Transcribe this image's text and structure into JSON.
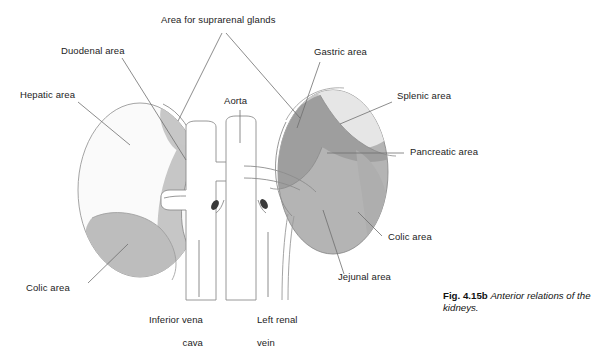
{
  "figure": {
    "title": "Anterior relations of the kidneys",
    "caption_number": "Fig. 4.15b",
    "caption_text": "Anterior relations of the kidneys.",
    "type": "anatomical-line-diagram"
  },
  "labels": {
    "suprarenal": "Area for suprarenal glands",
    "duodenal": "Duodenal area",
    "hepatic": "Hepatic area",
    "aorta": "Aorta",
    "gastric": "Gastric area",
    "splenic": "Splenic area",
    "pancreatic": "Pancreatic area",
    "colic_right": "Colic area",
    "colic_left": "Colic area",
    "jejunal": "Jejunal area",
    "ivc_line1": "Inferior vena",
    "ivc_line2": "cava",
    "renal_vein_line1": "Left renal",
    "renal_vein_line2": "vein"
  },
  "colors": {
    "outline": "#8c8c8c",
    "leader": "#6e6e6e",
    "hepatic_fill": "#fafafa",
    "duodenal_fill": "#c6c6c6",
    "suprarenal_fill": "#c4c4c4",
    "colic_right_fill": "#bdbdbd",
    "splenic_fill": "#e6e6e6",
    "gastric_fill": "#c9c9c9",
    "pancreatic_fill": "#9e9e9e",
    "jejunal_fill": "#b4b4b4",
    "colic_left_fill": "#b0b0b0",
    "vessel_fill": "#ffffff",
    "vessel_stub": "#3a3a3a",
    "text": "#1c1c1c",
    "background": "#ffffff"
  },
  "structures": {
    "right_kidney_regions": [
      "Area for suprarenal glands",
      "Hepatic area",
      "Duodenal area",
      "Colic area"
    ],
    "left_kidney_regions": [
      "Area for suprarenal glands",
      "Gastric area",
      "Splenic area",
      "Pancreatic area",
      "Jejunal area",
      "Colic area"
    ],
    "vessels": [
      "Aorta",
      "Inferior vena cava",
      "Left renal vein"
    ]
  }
}
